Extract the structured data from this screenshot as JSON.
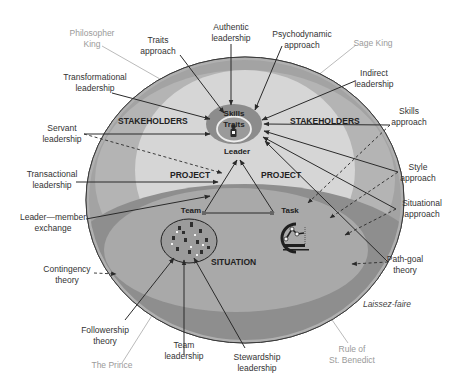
{
  "diagram": {
    "colors": {
      "outer_ring": "#a3a3a3",
      "stakeholders": "#b9b9b9",
      "project": "#d8d8d8",
      "situation_outer": "#8e8e8e",
      "situation_inner": "#a9a9a9",
      "leader_core": "#8c8c8c",
      "traits_ring": "#e8e8e8",
      "line": "#2a2a2a",
      "historical_label": "#9a9a9a"
    },
    "zones": {
      "stakeholders_left": "STAKEHOLDERS",
      "stakeholders_right": "STAKEHOLDERS",
      "project_left": "PROJECT",
      "project_right": "PROJECT",
      "situation": "SITUATION"
    },
    "nodes": {
      "skills": "Skills",
      "traits": "Traits",
      "leader": "Leader",
      "team": "Team",
      "task": "Task"
    },
    "theories_left": [
      {
        "line1": "Transformational",
        "line2": "leadership"
      },
      {
        "line1": "Servant",
        "line2": "leadership"
      },
      {
        "line1": "Transactional",
        "line2": "leadership"
      },
      {
        "line1": "Leader—member",
        "line2": "exchange"
      },
      {
        "line1": "Contingency",
        "line2": "theory"
      },
      {
        "line1": "Followership",
        "line2": "theory"
      }
    ],
    "theories_top": [
      {
        "line1": "Traits",
        "line2": "approach"
      },
      {
        "line1": "Authentic",
        "line2": "leadership"
      },
      {
        "line1": "Psychodynamic",
        "line2": "approach"
      }
    ],
    "theories_right": [
      {
        "line1": "Indirect",
        "line2": "leadership"
      },
      {
        "line1": "Skills",
        "line2": "approach"
      },
      {
        "line1": "Style",
        "line2": "approach"
      },
      {
        "line1": "Situational",
        "line2": "approach"
      },
      {
        "line1": "Path-goal",
        "line2": "theory"
      }
    ],
    "theories_bottom": [
      {
        "line1": "Team",
        "line2": "leadership"
      },
      {
        "line1": "Stewardship",
        "line2": "leadership"
      }
    ],
    "laissez_faire": "Laissez-faire",
    "historical": {
      "philosopher_king": {
        "line1": "Philosopher",
        "line2": "King"
      },
      "sage_king": "Sage King",
      "the_prince": "The Prince",
      "rule_of_st_benedict": {
        "line1": "Rule of",
        "line2": "St. Benedict"
      }
    }
  }
}
